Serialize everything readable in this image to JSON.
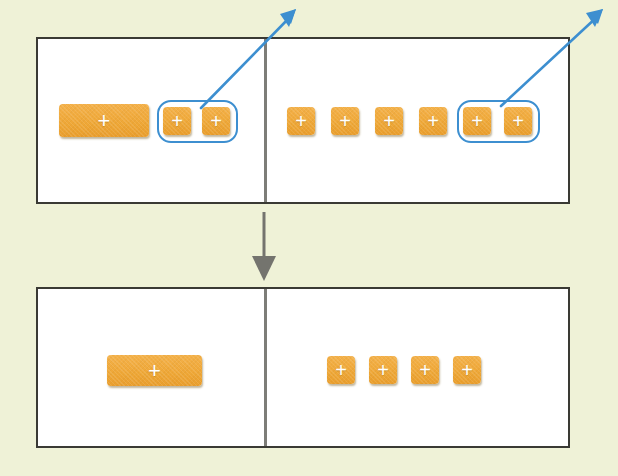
{
  "diagram": {
    "background_color": "#eff2d7",
    "block_color": "#efa838",
    "highlight_color": "#3d8fd0",
    "divider_color": "#7d7d78",
    "panel_border_color": "#3a3a34",
    "symbol": "+",
    "step_arrow": {
      "name": "down-arrow",
      "direction": "down",
      "color": "#7d7d78"
    },
    "panels": [
      {
        "id": "before",
        "label": "Before regrouping",
        "left_column": {
          "label": "tens",
          "rods": [
            {
              "label": "ten-rod",
              "symbol": "+",
              "width": 90,
              "height": 33
            }
          ],
          "units": [
            {
              "label": "unit-cube",
              "symbol": "+",
              "highlighted": true
            },
            {
              "label": "unit-cube",
              "symbol": "+",
              "highlighted": true
            }
          ],
          "highlight_group": {
            "label": "grouped-units-left",
            "count": 2,
            "color": "#3d8fd0",
            "callout_arrow": {
              "name": "callout-arrow-left",
              "color": "#3d8fd0",
              "direction": "up-right"
            }
          }
        },
        "right_column": {
          "label": "ones",
          "units": [
            {
              "label": "unit-cube",
              "symbol": "+",
              "highlighted": false
            },
            {
              "label": "unit-cube",
              "symbol": "+",
              "highlighted": false
            },
            {
              "label": "unit-cube",
              "symbol": "+",
              "highlighted": false
            },
            {
              "label": "unit-cube",
              "symbol": "+",
              "highlighted": false
            },
            {
              "label": "unit-cube",
              "symbol": "+",
              "highlighted": true
            },
            {
              "label": "unit-cube",
              "symbol": "+",
              "highlighted": true
            }
          ],
          "highlight_group": {
            "label": "grouped-units-right",
            "count": 2,
            "color": "#3d8fd0",
            "callout_arrow": {
              "name": "callout-arrow-right",
              "color": "#3d8fd0",
              "direction": "up-right"
            }
          }
        }
      },
      {
        "id": "after",
        "label": "After regrouping",
        "left_column": {
          "label": "tens",
          "rods": [
            {
              "label": "ten-rod",
              "symbol": "+",
              "width": 95,
              "height": 31
            }
          ],
          "units": []
        },
        "right_column": {
          "label": "ones",
          "units": [
            {
              "label": "unit-cube",
              "symbol": "+",
              "highlighted": false
            },
            {
              "label": "unit-cube",
              "symbol": "+",
              "highlighted": false
            },
            {
              "label": "unit-cube",
              "symbol": "+",
              "highlighted": false
            },
            {
              "label": "unit-cube",
              "symbol": "+",
              "highlighted": false
            }
          ]
        }
      }
    ]
  }
}
